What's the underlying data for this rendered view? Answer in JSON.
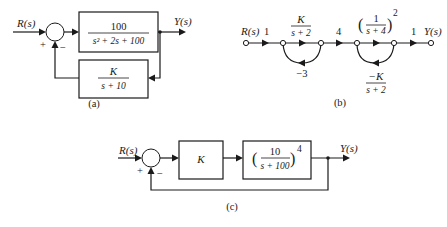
{
  "figure": {
    "a": {
      "caption": "(a)",
      "input_label": "R(s)",
      "output_label": "Y(s)",
      "sum_plus": "+",
      "sum_minus": "−",
      "forward_block": {
        "numerator": "100",
        "denominator": "s² + 2s + 100"
      },
      "feedback_block": {
        "numerator": "K",
        "denominator": "s + 10"
      }
    },
    "b": {
      "caption": "(b)",
      "input_label": "R(s)",
      "output_label": "Y(s)",
      "branch_gains": [
        "1",
        "K / (s + 2)",
        "4",
        "(1/(s + 4))²",
        "1"
      ],
      "branch_1": "1",
      "branch_2": {
        "numerator": "K",
        "denominator": "s + 2"
      },
      "branch_3": "4",
      "branch_4": {
        "numerator": "1",
        "denominator": "s + 4",
        "exponent": "2",
        "open_paren": "(",
        "close_paren": ")"
      },
      "branch_5": "1",
      "loop_1": "−3",
      "loop_2": {
        "numerator": "−K",
        "denominator": "s + 2"
      }
    },
    "c": {
      "caption": "(c)",
      "input_label": "R(s)",
      "output_label": "Y(s)",
      "sum_plus": "+",
      "sum_minus": "−",
      "block_1": "K",
      "block_2": {
        "numerator": "10",
        "denominator": "s + 100",
        "exponent": "4",
        "open_paren": "(",
        "close_paren": ")"
      }
    }
  }
}
